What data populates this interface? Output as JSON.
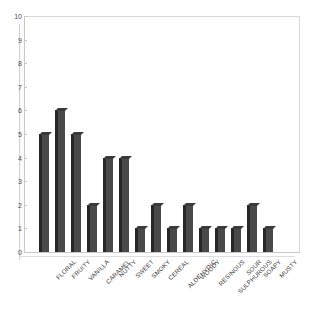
{
  "chart_data": {
    "type": "bar",
    "title": "",
    "subtitle": "",
    "xlabel": "",
    "ylabel": "",
    "ylim": [
      0,
      10
    ],
    "ytick_values": [
      10,
      9,
      8,
      7,
      6,
      5,
      4,
      3,
      2,
      1,
      0
    ],
    "grid": false,
    "legend": false,
    "legend_position": "none",
    "bar_color": "#4a4a4a",
    "bar_shadow_color": "#262626",
    "axis_color": "#c9c9c9",
    "background_color": "#ffffff",
    "categories": [
      "FLORAL",
      "FRUITY",
      "VANILLA",
      "CARAMEL",
      "NUTTY",
      "SWEET",
      "SMOKY",
      "CEREAL",
      "ALDEHYDIC",
      "WOODY",
      "RESINOUS",
      "SULPHUROUS",
      "SOUR",
      "SOAPY",
      "MUSTY"
    ],
    "values": [
      5,
      6,
      5,
      2,
      4,
      4,
      1,
      2,
      1,
      2,
      1,
      1,
      1,
      2,
      1
    ]
  }
}
